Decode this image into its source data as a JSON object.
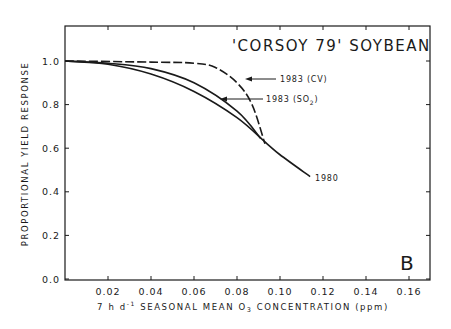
{
  "chart_data": {
    "type": "line",
    "title": "'CORSOY 79' SOYBEAN",
    "panel_label": "B",
    "xlabel": "7 h d⁻¹ SEASONAL MEAN O₃ CONCENTRATION (ppm)",
    "ylabel": "PROPORTIONAL YIELD RESPONSE",
    "xlim": [
      0,
      0.17
    ],
    "ylim": [
      0,
      1.15
    ],
    "x_ticks": [
      "0.02",
      "0.04",
      "0.06",
      "0.08",
      "0.10",
      "0.12",
      "0.14",
      "0.16"
    ],
    "y_ticks": [
      "0.0",
      "0.2",
      "0.4",
      "0.6",
      "0.8",
      "1.0"
    ],
    "grid": false,
    "legend": "inline annotations",
    "series": [
      {
        "name": "1980",
        "style": "solid",
        "x": [
          0,
          0.02,
          0.04,
          0.06,
          0.08,
          0.094,
          0.1,
          0.114
        ],
        "y": [
          1.0,
          0.985,
          0.94,
          0.86,
          0.74,
          0.62,
          0.57,
          0.47
        ]
      },
      {
        "name": "1983 (SO2)",
        "style": "solid",
        "x": [
          0,
          0.02,
          0.04,
          0.06,
          0.08,
          0.091
        ],
        "y": [
          1.0,
          0.99,
          0.965,
          0.9,
          0.77,
          0.645
        ]
      },
      {
        "name": "1983 (CV)",
        "style": "dashed",
        "x": [
          0,
          0.04,
          0.06,
          0.07,
          0.08,
          0.087,
          0.093
        ],
        "y": [
          1.0,
          0.995,
          0.99,
          0.97,
          0.9,
          0.8,
          0.62
        ]
      }
    ],
    "annotations": [
      {
        "text": "1983 (CV)",
        "arrow_to_series": "1983 (CV)"
      },
      {
        "text": "1983 (SO",
        "sub": "2",
        "close": ")",
        "arrow_to_series": "1983 (SO2)"
      },
      {
        "text": "1980",
        "label_for_series": "1980"
      }
    ]
  },
  "labels": {
    "title": "'CORSOY 79' SOYBEAN",
    "panel": "B",
    "ylabel": "PROPORTIONAL YIELD RESPONSE",
    "xlabel_prefix": "7 h d",
    "xlabel_sup": "-1",
    "xlabel_mid": " SEASONAL MEAN O",
    "xlabel_sub": "3",
    "xlabel_suffix": " CONCENTRATION (ppm)",
    "annot_cv": "1983 (CV)",
    "annot_so2_main": "1983 (SO",
    "annot_so2_sub": "2",
    "annot_so2_close": ")",
    "annot_1980": "1980"
  }
}
